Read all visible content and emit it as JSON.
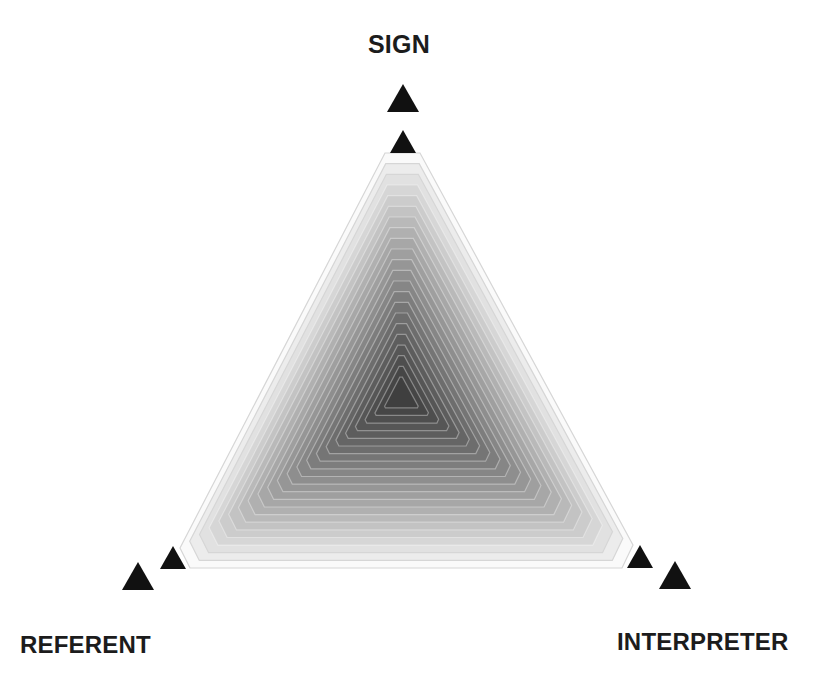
{
  "diagram": {
    "type": "semiotic-triangle",
    "vertices": {
      "top": {
        "label": "SIGN"
      },
      "bottom_left": {
        "label": "REFERENT"
      },
      "bottom_right": {
        "label": "INTERPRETER"
      }
    },
    "fill": {
      "style": "concentric-contour-gradient",
      "center_color": "#3a3a3a",
      "edge_color": "#ffffff",
      "contour_line_color": "#c8c8c8",
      "contour_count": 22
    },
    "markers": {
      "color": "#111111",
      "shape": "solid-triangle",
      "per_vertex": 2
    }
  }
}
